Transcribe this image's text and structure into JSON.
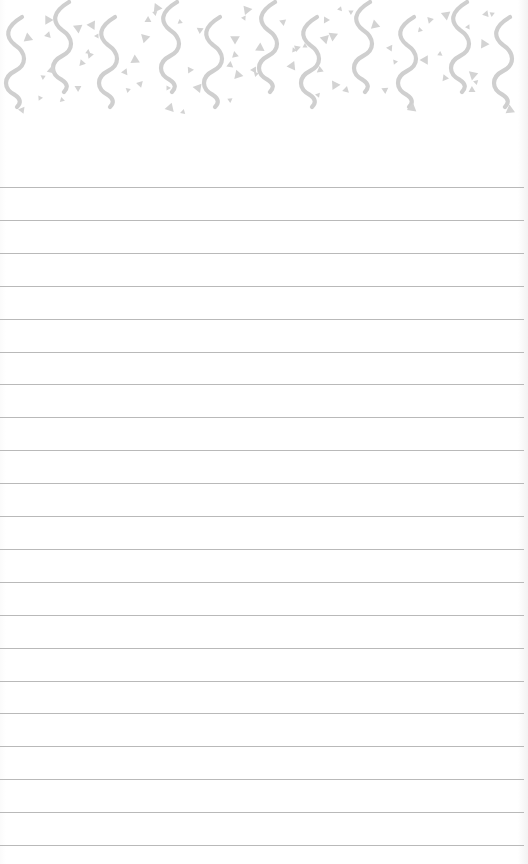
{
  "page": {
    "type": "lined-notepad",
    "background_color": "#ffffff",
    "line_color": "#b9b9b9",
    "pattern_color": "#cfcfcf"
  },
  "header_pattern": {
    "style": "confetti-squiggles",
    "waves": [
      {
        "x": 15,
        "y": 15,
        "variant": "lower"
      },
      {
        "x": 62,
        "y": 0,
        "variant": "upper"
      },
      {
        "x": 108,
        "y": 15,
        "variant": "lower"
      },
      {
        "x": 170,
        "y": 0,
        "variant": "upper"
      },
      {
        "x": 213,
        "y": 15,
        "variant": "lower"
      },
      {
        "x": 268,
        "y": 0,
        "variant": "upper"
      },
      {
        "x": 310,
        "y": 15,
        "variant": "lower"
      },
      {
        "x": 363,
        "y": 0,
        "variant": "upper"
      },
      {
        "x": 407,
        "y": 15,
        "variant": "lower"
      },
      {
        "x": 460,
        "y": 0,
        "variant": "upper"
      },
      {
        "x": 503,
        "y": 15,
        "variant": "lower"
      }
    ],
    "triangles": [
      [
        48,
        20
      ],
      [
        48,
        35
      ],
      [
        43,
        77
      ],
      [
        28,
        38
      ],
      [
        22,
        110
      ],
      [
        40,
        98
      ],
      [
        52,
        70
      ],
      [
        78,
        88
      ],
      [
        62,
        100
      ],
      [
        92,
        25
      ],
      [
        90,
        55
      ],
      [
        88,
        52
      ],
      [
        78,
        28
      ],
      [
        82,
        63
      ],
      [
        97,
        36
      ],
      [
        145,
        38
      ],
      [
        148,
        20
      ],
      [
        155,
        13
      ],
      [
        157,
        8
      ],
      [
        125,
        72
      ],
      [
        128,
        90
      ],
      [
        135,
        60
      ],
      [
        140,
        84
      ],
      [
        168,
        88
      ],
      [
        170,
        108
      ],
      [
        200,
        30
      ],
      [
        180,
        22
      ],
      [
        198,
        88
      ],
      [
        190,
        70
      ],
      [
        183,
        112
      ],
      [
        235,
        39
      ],
      [
        235,
        55
      ],
      [
        244,
        18
      ],
      [
        247,
        10
      ],
      [
        230,
        65
      ],
      [
        230,
        100
      ],
      [
        238,
        75
      ],
      [
        254,
        70
      ],
      [
        256,
        74
      ],
      [
        260,
        48
      ],
      [
        283,
        22
      ],
      [
        294,
        50
      ],
      [
        292,
        66
      ],
      [
        297,
        48
      ],
      [
        305,
        46
      ],
      [
        325,
        39
      ],
      [
        326,
        20
      ],
      [
        340,
        9
      ],
      [
        333,
        36
      ],
      [
        320,
        70
      ],
      [
        318,
        95
      ],
      [
        335,
        85
      ],
      [
        346,
        90
      ],
      [
        351,
        12
      ],
      [
        375,
        25
      ],
      [
        390,
        48
      ],
      [
        395,
        62
      ],
      [
        412,
        108
      ],
      [
        385,
        90
      ],
      [
        420,
        30
      ],
      [
        425,
        60
      ],
      [
        430,
        20
      ],
      [
        440,
        54
      ],
      [
        446,
        15
      ],
      [
        445,
        78
      ],
      [
        468,
        27
      ],
      [
        473,
        75
      ],
      [
        472,
        90
      ],
      [
        476,
        82
      ],
      [
        484,
        44
      ],
      [
        486,
        14
      ],
      [
        492,
        14
      ],
      [
        510,
        110
      ]
    ]
  },
  "ruled_lines": {
    "first_y": 187,
    "spacing": 32.9,
    "count": 21
  }
}
